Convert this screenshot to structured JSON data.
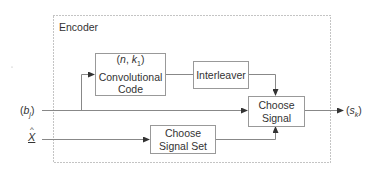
{
  "diagram": {
    "container": {
      "label": "Encoder",
      "style": "dotted"
    },
    "blocks": {
      "conv_code": {
        "line1_prefix": "(",
        "n": "n",
        "sep": ", ",
        "k": "k",
        "k_sub": "1",
        "line1_suffix": ")",
        "line2": "Convolutional",
        "line3": "Code"
      },
      "interleaver": {
        "label": "Interleaver"
      },
      "choose_signal": {
        "line1": "Choose",
        "line2": "Signal"
      },
      "choose_signal_set": {
        "line1": "Choose",
        "line2": "Signal Set"
      }
    },
    "inputs": {
      "b": {
        "open": "(",
        "var": "b",
        "sub": "j",
        "close": ")"
      },
      "x": {
        "var": "X",
        "accent": "^",
        "underline": true
      }
    },
    "outputs": {
      "s": {
        "open": "(",
        "var": "s",
        "sub": "k",
        "close": ")"
      }
    },
    "edges": [
      {
        "from": "b",
        "to": "choose_signal"
      },
      {
        "from": "b",
        "to": "conv_code"
      },
      {
        "from": "conv_code",
        "to": "interleaver"
      },
      {
        "from": "interleaver",
        "to": "choose_signal"
      },
      {
        "from": "x",
        "to": "choose_signal_set"
      },
      {
        "from": "choose_signal_set",
        "to": "choose_signal"
      },
      {
        "from": "choose_signal",
        "to": "s"
      }
    ],
    "colors": {
      "line": "#888888",
      "text": "#333333",
      "border": "#999999"
    }
  }
}
